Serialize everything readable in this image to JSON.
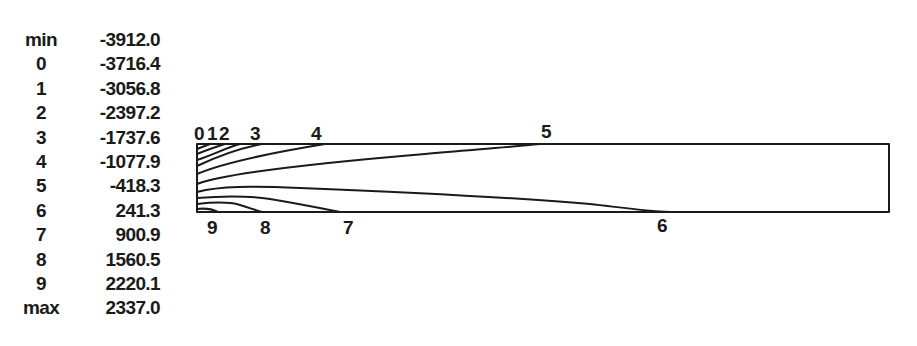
{
  "legend": {
    "rows": [
      {
        "key": "min",
        "value": "-3912.0"
      },
      {
        "key": "0",
        "value": "-3716.4"
      },
      {
        "key": "1",
        "value": "-3056.8"
      },
      {
        "key": "2",
        "value": "-2397.2"
      },
      {
        "key": "3",
        "value": "-1737.6"
      },
      {
        "key": "4",
        "value": "-1077.9"
      },
      {
        "key": "5",
        "value": "-418.3"
      },
      {
        "key": "6",
        "value": "241.3"
      },
      {
        "key": "7",
        "value": "900.9"
      },
      {
        "key": "8",
        "value": "1560.5"
      },
      {
        "key": "9",
        "value": "2220.1"
      },
      {
        "key": "max",
        "value": "2337.0"
      }
    ]
  },
  "contour_labels": {
    "top": [
      {
        "text": "0",
        "x": 194
      },
      {
        "text": "1",
        "x": 207
      },
      {
        "text": "2",
        "x": 219
      },
      {
        "text": "3",
        "x": 250
      },
      {
        "text": "4",
        "x": 311
      },
      {
        "text": "5",
        "x": 541
      }
    ],
    "bottom": [
      {
        "text": "9",
        "x": 207
      },
      {
        "text": "8",
        "x": 260
      },
      {
        "text": "7",
        "x": 343
      },
      {
        "text": "6",
        "x": 657
      }
    ]
  },
  "colors": {
    "ink": "#1a1a1a",
    "background": "#ffffff"
  }
}
